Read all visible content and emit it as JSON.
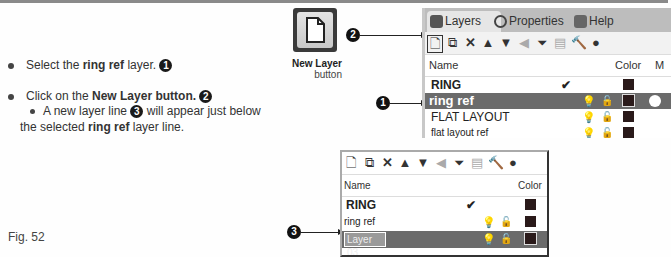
{
  "instructions": {
    "step1": {
      "pre": "Select the ",
      "bold": "ring ref",
      "post": " layer.",
      "callout": "1"
    },
    "step2": {
      "pre": "Click on the ",
      "bold": "New Layer button.",
      "callout": "2"
    },
    "step2_sub": {
      "pre": "A new layer line ",
      "callout": "3",
      "post": " will appear just below"
    },
    "step2_sub_line2": {
      "pre": "the selected ",
      "bold": "ring ref",
      "post": " layer line."
    }
  },
  "figure_label": "Fig. 52",
  "new_layer_button": {
    "label_bold": "New Layer",
    "label_sub": "button"
  },
  "callouts": {
    "one": "1",
    "two": "2",
    "three": "3"
  },
  "layers_panel": {
    "tabs": [
      {
        "label": "Layers",
        "icon": "layers-icon",
        "active": true
      },
      {
        "label": "Properties",
        "icon": "properties-icon",
        "active": false
      },
      {
        "label": "Help",
        "icon": "help-icon",
        "active": false
      }
    ],
    "toolbar": [
      "new-layer-icon",
      "new-sublayer-icon",
      "delete-icon",
      "move-up-icon",
      "move-down-icon",
      "move-left-icon",
      "filter-icon",
      "clipboard-icon",
      "tools-icon",
      "help-icon"
    ],
    "columns": {
      "name": "Name",
      "color": "Color",
      "material": "M"
    },
    "rows": [
      {
        "name": "RING",
        "current": true,
        "selected": false
      },
      {
        "name": "ring ref",
        "current": false,
        "selected": true
      },
      {
        "name": "FLAT LAYOUT",
        "current": false,
        "selected": false
      },
      {
        "name": "flat layout ref",
        "current": false,
        "selected": false
      }
    ]
  },
  "layers_panel_after": {
    "columns": {
      "name": "Name",
      "color": "Color"
    },
    "rows": [
      {
        "name": "RING",
        "current": true
      },
      {
        "name": "ring ref",
        "current": false
      },
      {
        "name": "Layer 03",
        "editing": true,
        "selected": true
      }
    ]
  }
}
